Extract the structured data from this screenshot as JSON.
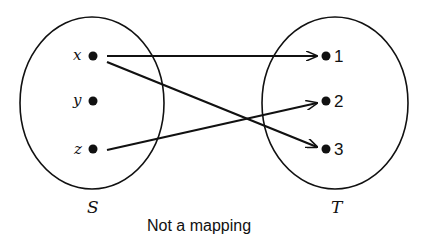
{
  "diagram": {
    "caption": "Not a mapping",
    "sets": [
      {
        "name": "S",
        "elements": [
          "x",
          "y",
          "z"
        ]
      },
      {
        "name": "T",
        "elements": [
          "1",
          "2",
          "3"
        ]
      }
    ],
    "arrows": [
      {
        "from": "x",
        "to": "1"
      },
      {
        "from": "x",
        "to": "3"
      },
      {
        "from": "z",
        "to": "2"
      }
    ],
    "colors": {
      "stroke": "#111111",
      "background": "#ffffff"
    }
  }
}
